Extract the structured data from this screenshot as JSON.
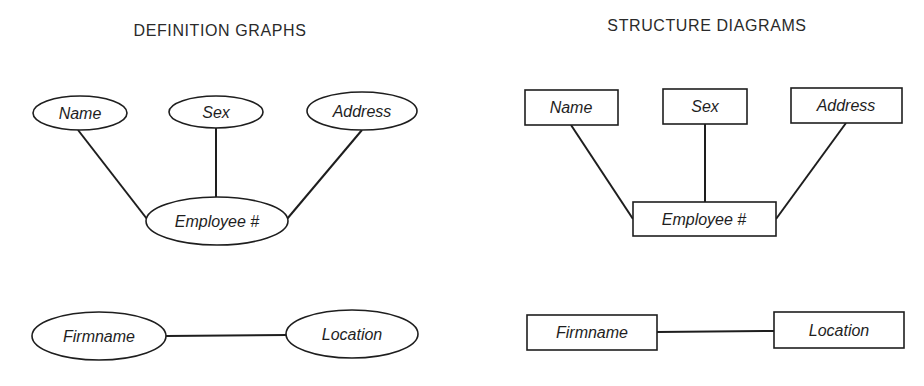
{
  "definition_graphs": {
    "title": "DEFINITION GRAPHS",
    "shape": "ellipse",
    "nodes": {
      "name": "Name",
      "sex": "Sex",
      "address": "Address",
      "employee": "Employee #",
      "firmname": "Firmname",
      "location": "Location"
    },
    "edges": [
      [
        "Name",
        "Employee #"
      ],
      [
        "Sex",
        "Employee #"
      ],
      [
        "Address",
        "Employee #"
      ],
      [
        "Firmname",
        "Location"
      ]
    ]
  },
  "structure_diagrams": {
    "title": "STRUCTURE DIAGRAMS",
    "shape": "rectangle",
    "nodes": {
      "name": "Name",
      "sex": "Sex",
      "address": "Address",
      "employee": "Employee #",
      "firmname": "Firmname",
      "location": "Location"
    },
    "edges": [
      [
        "Name",
        "Employee #"
      ],
      [
        "Sex",
        "Employee #"
      ],
      [
        "Address",
        "Employee #"
      ],
      [
        "Firmname",
        "Location"
      ]
    ]
  },
  "colors": {
    "ink": "#1e1e1e",
    "background": "#ffffff"
  }
}
